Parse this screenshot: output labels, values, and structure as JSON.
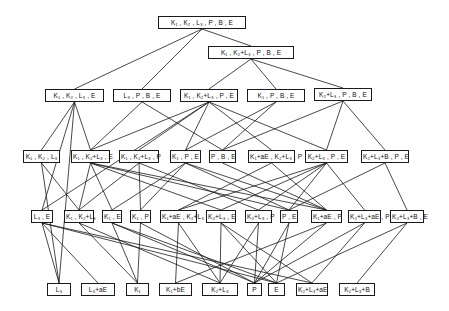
{
  "diagram": {
    "type": "lattice",
    "line_color": "#1a1a1a",
    "nodes": [
      {
        "id": "n0",
        "label": "K₁ , K₂ , L₃ , P , B , E",
        "x": 158,
        "y": 16,
        "w": 88
      },
      {
        "id": "n1",
        "label": "K₁ , K₂+L₃ , P , B , E",
        "x": 208,
        "y": 46,
        "w": 86
      },
      {
        "id": "r2a",
        "label": "K₁ , K₂ , L₃ , E",
        "x": 45,
        "y": 89,
        "w": 59
      },
      {
        "id": "r2b",
        "label": "L₃ , P , B , E",
        "x": 113,
        "y": 89,
        "w": 58
      },
      {
        "id": "r2c",
        "label": "K₁ , K₂+L₃ , P , E",
        "x": 180,
        "y": 89,
        "w": 58
      },
      {
        "id": "r2d",
        "label": "K₁ , P , B , E",
        "x": 247,
        "y": 89,
        "w": 58
      },
      {
        "id": "r2e",
        "label": "K₂+L₃ , P , B , E",
        "x": 314,
        "y": 88,
        "w": 58
      },
      {
        "id": "r3a",
        "label": "K₁ , K₂ , L₃",
        "x": 23,
        "y": 150,
        "w": 37
      },
      {
        "id": "r3b",
        "label": "K₁ , K₂+L₃ , E",
        "x": 71,
        "y": 150,
        "w": 39
      },
      {
        "id": "r3c",
        "label": "K₁ , K₂+L₃ , P",
        "x": 119,
        "y": 150,
        "w": 40
      },
      {
        "id": "r3d",
        "label": "K₁ , P , E",
        "x": 170,
        "y": 150,
        "w": 31
      },
      {
        "id": "r3e",
        "label": "P , B , E",
        "x": 209,
        "y": 150,
        "w": 27
      },
      {
        "id": "r3f",
        "label": "K₁+aE , K₂+L₃ , P",
        "x": 248,
        "y": 150,
        "w": 47
      },
      {
        "id": "r3g",
        "label": "K₂+L₃ , P , E",
        "x": 305,
        "y": 150,
        "w": 43
      },
      {
        "id": "r3h",
        "label": "K₂+L₃+B , P , E",
        "x": 361,
        "y": 150,
        "w": 48
      },
      {
        "id": "r4a",
        "label": "L₃ , E",
        "x": 31,
        "y": 210,
        "w": 22
      },
      {
        "id": "r4b",
        "label": "K₁ , K₂+L₃",
        "x": 64,
        "y": 210,
        "w": 30
      },
      {
        "id": "r4c",
        "label": "K₁ , E",
        "x": 102,
        "y": 210,
        "w": 20
      },
      {
        "id": "r4d",
        "label": "K₁ , P",
        "x": 130,
        "y": 210,
        "w": 21
      },
      {
        "id": "r4e",
        "label": "K₁+aE , K₂+L₃",
        "x": 160,
        "y": 210,
        "w": 37
      },
      {
        "id": "r4f",
        "label": "K₂+L₃ , E",
        "x": 206,
        "y": 210,
        "w": 30
      },
      {
        "id": "r4g",
        "label": "K₂+L₃ , P",
        "x": 245,
        "y": 210,
        "w": 27
      },
      {
        "id": "r4h",
        "label": "P , E",
        "x": 280,
        "y": 210,
        "w": 18
      },
      {
        "id": "r4i",
        "label": "K₁+aE , P",
        "x": 311,
        "y": 210,
        "w": 31
      },
      {
        "id": "r4j",
        "label": "K₂+L₃+aE , P",
        "x": 348,
        "y": 210,
        "w": 33
      },
      {
        "id": "r4k",
        "label": "K₂+L₃+B , E",
        "x": 390,
        "y": 210,
        "w": 34
      },
      {
        "id": "r5a",
        "label": "L₃",
        "x": 47,
        "y": 283,
        "w": 24
      },
      {
        "id": "r5b",
        "label": "L₃+aE",
        "x": 81,
        "y": 283,
        "w": 34
      },
      {
        "id": "r5c",
        "label": "K₁",
        "x": 126,
        "y": 283,
        "w": 23
      },
      {
        "id": "r5d",
        "label": "K₁+bE",
        "x": 159,
        "y": 283,
        "w": 33
      },
      {
        "id": "r5e",
        "label": "K₂+L₃",
        "x": 202,
        "y": 283,
        "w": 36
      },
      {
        "id": "r5f",
        "label": "P",
        "x": 247,
        "y": 283,
        "w": 15
      },
      {
        "id": "r5g",
        "label": "E",
        "x": 268,
        "y": 283,
        "w": 17
      },
      {
        "id": "r5h",
        "label": "K₂+L₃+aE",
        "x": 296,
        "y": 283,
        "w": 32
      },
      {
        "id": "r5i",
        "label": "K₂+L₃+B",
        "x": 339,
        "y": 283,
        "w": 36
      }
    ],
    "edges": [
      [
        "n0",
        "r2a"
      ],
      [
        "n0",
        "r2b"
      ],
      [
        "n0",
        "n1"
      ],
      [
        "n1",
        "r2c"
      ],
      [
        "n1",
        "r2d"
      ],
      [
        "n1",
        "r2e"
      ],
      [
        "r2a",
        "r3a"
      ],
      [
        "r2a",
        "r3b"
      ],
      [
        "r2a",
        "r4a"
      ],
      [
        "r2a",
        "r5a"
      ],
      [
        "r2b",
        "r3b"
      ],
      [
        "r2b",
        "r3e"
      ],
      [
        "r2c",
        "r3b"
      ],
      [
        "r2c",
        "r3c"
      ],
      [
        "r2c",
        "r3d"
      ],
      [
        "r2c",
        "r3f"
      ],
      [
        "r2c",
        "r3g"
      ],
      [
        "r2c",
        "r4a"
      ],
      [
        "r2d",
        "r3d"
      ],
      [
        "r2d",
        "r3e"
      ],
      [
        "r2e",
        "r3e"
      ],
      [
        "r2e",
        "r3g"
      ],
      [
        "r2e",
        "r3h"
      ],
      [
        "r3a",
        "r4b"
      ],
      [
        "r3a",
        "r5a"
      ],
      [
        "r3b",
        "r4b"
      ],
      [
        "r3b",
        "r4c"
      ],
      [
        "r3b",
        "r4f"
      ],
      [
        "r3b",
        "r4h"
      ],
      [
        "r3b",
        "r4i"
      ],
      [
        "r3c",
        "r4b"
      ],
      [
        "r3c",
        "r4d"
      ],
      [
        "r3c",
        "r4g"
      ],
      [
        "r3d",
        "r4c"
      ],
      [
        "r3d",
        "r4d"
      ],
      [
        "r3d",
        "r4h"
      ],
      [
        "r3d",
        "r4i"
      ],
      [
        "r3e",
        "r4i"
      ],
      [
        "r3f",
        "r4e"
      ],
      [
        "r3f",
        "r4i"
      ],
      [
        "r3g",
        "r4e"
      ],
      [
        "r3g",
        "r4f"
      ],
      [
        "r3g",
        "r4g"
      ],
      [
        "r3g",
        "r4h"
      ],
      [
        "r3g",
        "r4j"
      ],
      [
        "r3h",
        "r4h"
      ],
      [
        "r3h",
        "r4k"
      ],
      [
        "r4a",
        "r5a"
      ],
      [
        "r4a",
        "r5b"
      ],
      [
        "r4a",
        "r5g"
      ],
      [
        "r4a",
        "r5h"
      ],
      [
        "r4b",
        "r5c"
      ],
      [
        "r4b",
        "r5e"
      ],
      [
        "r4c",
        "r5c"
      ],
      [
        "r4c",
        "r5f"
      ],
      [
        "r4c",
        "r5g"
      ],
      [
        "r4d",
        "r5c"
      ],
      [
        "r4d",
        "r5f"
      ],
      [
        "r4e",
        "r5d"
      ],
      [
        "r4e",
        "r5e"
      ],
      [
        "r4f",
        "r5e"
      ],
      [
        "r4f",
        "r5g"
      ],
      [
        "r4f",
        "r5h"
      ],
      [
        "r4g",
        "r5e"
      ],
      [
        "r4g",
        "r5f"
      ],
      [
        "r4h",
        "r5f"
      ],
      [
        "r4h",
        "r5g"
      ],
      [
        "r4i",
        "r5d"
      ],
      [
        "r4i",
        "r5f"
      ],
      [
        "r4j",
        "r5f"
      ],
      [
        "r4j",
        "r5h"
      ],
      [
        "r4k",
        "r5g"
      ],
      [
        "r4k",
        "r5i"
      ]
    ]
  }
}
